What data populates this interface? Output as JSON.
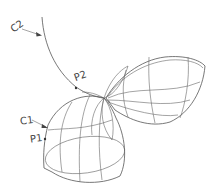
{
  "diagram": {
    "type": "wireframe-surface",
    "labels": {
      "c2": "C2",
      "c1": "C1",
      "p2": "P2",
      "p1": "P1"
    },
    "colors": {
      "line": "#555555",
      "background": "#ffffff"
    }
  }
}
